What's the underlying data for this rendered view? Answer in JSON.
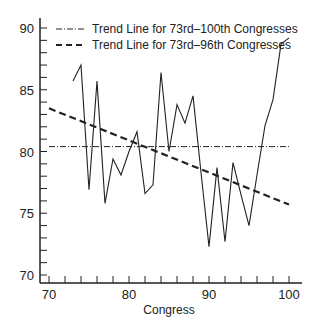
{
  "chart_data": {
    "type": "line",
    "title": "",
    "xlabel": "Congress",
    "ylabel": "",
    "xlim": [
      70,
      100
    ],
    "ylim": [
      70,
      90
    ],
    "x_ticks": [
      70,
      80,
      90,
      100
    ],
    "x_tick_labels": [
      "70",
      "80",
      "90",
      "100"
    ],
    "x_minor_step": 2,
    "y_ticks": [
      70,
      75,
      80,
      85,
      90
    ],
    "y_tick_labels": [
      "70",
      "75",
      "80",
      "85",
      "90"
    ],
    "y_minor_step": 1,
    "grid": false,
    "legend_position": "top-left",
    "series": [
      {
        "name": "Observed",
        "style": "solid",
        "x": [
          73,
          74,
          75,
          76,
          77,
          78,
          79,
          80,
          81,
          82,
          83,
          84,
          85,
          86,
          87,
          88,
          89,
          90,
          91,
          92,
          93,
          94,
          95,
          96,
          97,
          98,
          99,
          100
        ],
        "values": [
          85.7,
          87.0,
          76.9,
          85.7,
          75.8,
          79.4,
          78.1,
          80.0,
          81.6,
          76.6,
          77.3,
          86.4,
          80.0,
          83.8,
          82.3,
          84.5,
          78.3,
          72.3,
          78.7,
          72.7,
          79.1,
          76.5,
          74.0,
          78.1,
          82.1,
          84.2,
          88.7,
          89.2
        ]
      },
      {
        "name": "Trend Line for 73rd–100th Congresses",
        "style": "dash-dot",
        "x": [
          70,
          100
        ],
        "values": [
          80.4,
          80.4
        ]
      },
      {
        "name": "Trend Line for 73rd–96th Congresses",
        "style": "dashed",
        "x": [
          70,
          100
        ],
        "values": [
          83.5,
          75.7
        ]
      }
    ],
    "legend": [
      {
        "label": "Trend Line for 73rd–100th Congresses",
        "style": "dash-dot"
      },
      {
        "label": "Trend Line for 73rd–96th Congresses",
        "style": "dashed"
      }
    ]
  }
}
